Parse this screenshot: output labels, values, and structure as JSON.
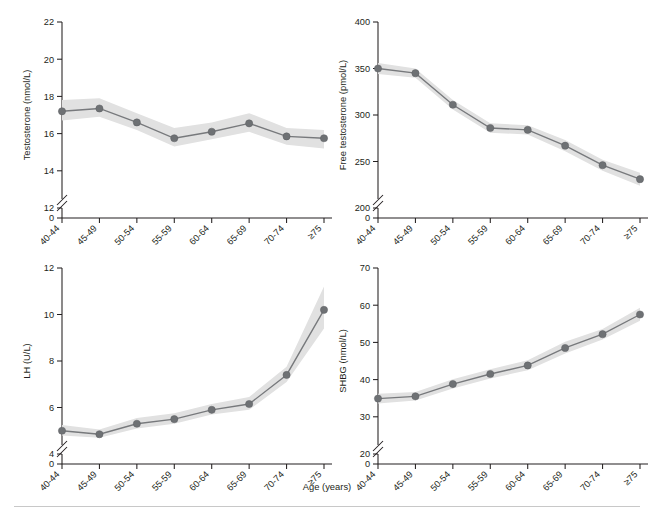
{
  "figure": {
    "xlabel": "Age (years)",
    "categories": [
      "40-44",
      "45-49",
      "50-54",
      "55-59",
      "60-64",
      "65-69",
      "70-74",
      "≥75"
    ],
    "colors": {
      "line": "#77797c",
      "marker": "#6e7174",
      "band": "#e1e1e1",
      "axis": "#231f20"
    }
  },
  "chart_data": [
    {
      "type": "line",
      "panel": "top-left",
      "title": "",
      "xlabel": "Age (years)",
      "ylabel": "Testosterone (nmol/L)",
      "categories": [
        "40-44",
        "45-49",
        "50-54",
        "55-59",
        "60-64",
        "65-69",
        "70-74",
        "≥75"
      ],
      "yticks": [
        0,
        12,
        14,
        16,
        18,
        20,
        22
      ],
      "ytick_labels": [
        "0",
        "12",
        "14",
        "16",
        "18",
        "20",
        "22"
      ],
      "ylim": [
        12,
        22
      ],
      "axis_break": true,
      "grid": false,
      "legend": "none",
      "values": [
        17.2,
        17.35,
        16.6,
        15.75,
        16.1,
        16.55,
        15.85,
        15.75
      ],
      "ci_lower": [
        16.7,
        16.9,
        16.2,
        15.3,
        15.7,
        16.1,
        15.4,
        15.2
      ],
      "ci_upper": [
        17.8,
        17.9,
        17.1,
        16.3,
        16.6,
        17.1,
        16.3,
        16.2
      ],
      "band_label": "95% CI"
    },
    {
      "type": "line",
      "panel": "top-right",
      "title": "",
      "xlabel": "Age (years)",
      "ylabel": "Free testosterone (pmol/L)",
      "categories": [
        "40-44",
        "45-49",
        "50-54",
        "55-59",
        "60-64",
        "65-69",
        "70-74",
        "≥75"
      ],
      "yticks": [
        0,
        200,
        250,
        300,
        350,
        400
      ],
      "ytick_labels": [
        "0",
        "200",
        "250",
        "300",
        "350",
        "400"
      ],
      "ylim": [
        200,
        400
      ],
      "axis_break": true,
      "grid": false,
      "legend": "none",
      "values": [
        350,
        345,
        311,
        286,
        284,
        267,
        246,
        231
      ],
      "ci_lower": [
        344,
        340,
        306,
        281,
        279,
        261,
        240,
        224
      ],
      "ci_upper": [
        356,
        350,
        316,
        291,
        289,
        273,
        252,
        238
      ],
      "band_label": "95% CI"
    },
    {
      "type": "line",
      "panel": "bottom-left",
      "title": "",
      "xlabel": "Age (years)",
      "ylabel": "LH (U/L)",
      "categories": [
        "40-44",
        "45-49",
        "50-54",
        "55-59",
        "60-64",
        "65-69",
        "70-74",
        "≥75"
      ],
      "yticks": [
        0,
        4,
        6,
        8,
        10,
        12
      ],
      "ytick_labels": [
        "0",
        "4",
        "6",
        "8",
        "10",
        "12"
      ],
      "ylim": [
        4,
        12
      ],
      "axis_break": true,
      "grid": false,
      "legend": "none",
      "values": [
        5.0,
        4.85,
        5.3,
        5.5,
        5.9,
        6.15,
        7.4,
        10.2
      ],
      "ci_lower": [
        4.8,
        4.7,
        5.1,
        5.3,
        5.7,
        5.9,
        7.1,
        9.4
      ],
      "ci_upper": [
        5.25,
        5.05,
        5.55,
        5.75,
        6.15,
        6.45,
        7.75,
        11.2
      ],
      "band_label": "95% CI"
    },
    {
      "type": "line",
      "panel": "bottom-right",
      "title": "",
      "xlabel": "Age (years)",
      "ylabel": "SHBG (nmol/L)",
      "categories": [
        "40-44",
        "45-49",
        "50-54",
        "55-59",
        "60-64",
        "65-69",
        "70-74",
        "≥75"
      ],
      "yticks": [
        0,
        20,
        30,
        40,
        50,
        60,
        70
      ],
      "ytick_labels": [
        "0",
        "20",
        "30",
        "40",
        "50",
        "60",
        "70"
      ],
      "ylim": [
        20,
        70
      ],
      "axis_break": true,
      "grid": false,
      "legend": "none",
      "values": [
        34.9,
        35.5,
        38.8,
        41.5,
        43.8,
        48.5,
        52.2,
        57.5
      ],
      "ci_lower": [
        33.6,
        34.4,
        37.6,
        40.3,
        42.5,
        47.0,
        50.8,
        55.8
      ],
      "ci_upper": [
        36.2,
        36.7,
        40.1,
        42.8,
        45.2,
        50.2,
        53.6,
        59.3
      ],
      "band_label": "95% CI"
    }
  ]
}
